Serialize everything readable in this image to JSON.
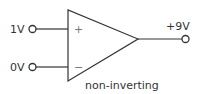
{
  "diagram": {
    "type": "op-amp",
    "caption": "non-inverting",
    "inputs": [
      {
        "label": "1V",
        "terminal": "+",
        "sign_label": "+"
      },
      {
        "label": "0V",
        "terminal": "-",
        "sign_label": "−"
      }
    ],
    "output": {
      "label": "+9V"
    },
    "colors": {
      "stroke": "#333333",
      "text": "#333333",
      "sign": "#777777",
      "background": "#ffffff"
    }
  }
}
